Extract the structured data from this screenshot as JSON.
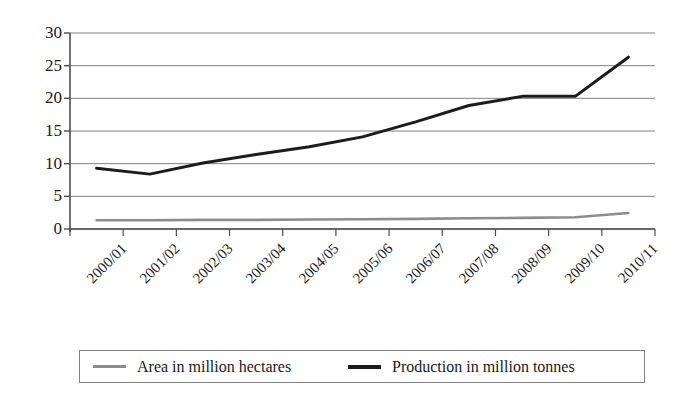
{
  "chart_data": {
    "type": "line",
    "title": "",
    "xlabel": "",
    "ylabel": "",
    "ylim": [
      0,
      30
    ],
    "ytick_values": [
      0,
      5,
      10,
      15,
      20,
      25,
      30
    ],
    "ytick_labels": [
      "0",
      "5",
      "10",
      "15",
      "20",
      "25",
      "30"
    ],
    "grid": true,
    "grid_axis": "y",
    "legend_position": "bottom",
    "categories": [
      "2000/01",
      "2001/02",
      "2002/03",
      "2003/04",
      "2004/05",
      "2005/06",
      "2006/07",
      "2007/08",
      "2008/09",
      "2009/10",
      "2010/11"
    ],
    "series": [
      {
        "name": "Area in million hectares",
        "color": "#8c8c8c",
        "values": [
          1.35,
          1.35,
          1.4,
          1.4,
          1.45,
          1.5,
          1.55,
          1.65,
          1.7,
          1.8,
          2.45
        ]
      },
      {
        "name": "Production in million tonnes",
        "color": "#1c1c1c",
        "values": [
          9.3,
          8.4,
          10.1,
          11.4,
          12.6,
          14.1,
          16.4,
          18.9,
          20.3,
          20.3,
          26.3
        ]
      }
    ]
  },
  "legend": {
    "items": [
      {
        "label": "Area in million hectares",
        "marker": "line-gray"
      },
      {
        "label": "Production in million tonnes",
        "marker": "line-black"
      }
    ]
  },
  "axes": {
    "y_axis_name": "value-axis",
    "x_axis_name": "period-axis"
  }
}
